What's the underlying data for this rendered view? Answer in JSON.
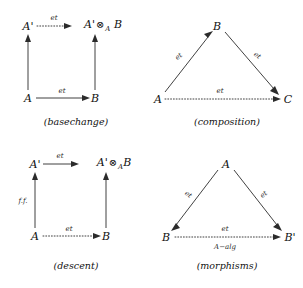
{
  "document": {
    "kind": "commutative-diagram-figure",
    "panel_count": 4
  },
  "panels": [
    {
      "id": "basechange",
      "caption": "(basechange)",
      "shape": "square",
      "nodes": {
        "top_left": "A'",
        "top_right_base": "A'",
        "top_right_tensor": "⊗",
        "top_right_sub": "A",
        "top_right_tail": "B",
        "bottom_left": "A",
        "bottom_right": "B"
      },
      "edges": {
        "top": {
          "label": "et",
          "style": "dotted",
          "direction": "left-to-right"
        },
        "bottom": {
          "label": "et",
          "style": "solid",
          "direction": "left-to-right"
        },
        "left": {
          "label": "",
          "style": "solid",
          "direction": "bottom-to-top"
        },
        "right": {
          "label": "",
          "style": "solid",
          "direction": "bottom-to-top"
        }
      }
    },
    {
      "id": "composition",
      "caption": "(composition)",
      "shape": "triangle",
      "nodes": {
        "apex": "B",
        "bottom_left": "A",
        "bottom_right": "C"
      },
      "edges": {
        "left": {
          "label": "et",
          "style": "solid",
          "direction": "up-right"
        },
        "right": {
          "label": "et",
          "style": "solid",
          "direction": "down-right"
        },
        "base": {
          "label": "et",
          "style": "dotted",
          "direction": "left-to-right"
        }
      }
    },
    {
      "id": "descent",
      "caption": "(descent)",
      "shape": "square",
      "nodes": {
        "top_left": "A'",
        "top_right_base": "A'",
        "top_right_tensor": "⊗",
        "top_right_sub": "A",
        "top_right_tail": "B",
        "bottom_left": "A",
        "bottom_right": "B"
      },
      "edges": {
        "top": {
          "label": "et",
          "style": "solid",
          "direction": "left-to-right"
        },
        "bottom": {
          "label": "et",
          "style": "dotted",
          "direction": "left-to-right"
        },
        "left": {
          "label": "f.f.",
          "style": "solid",
          "direction": "bottom-to-top"
        },
        "right": {
          "label": "",
          "style": "solid",
          "direction": "bottom-to-top"
        }
      }
    },
    {
      "id": "morphisms",
      "caption": "(morphisms)",
      "shape": "triangle",
      "nodes": {
        "apex": "A",
        "bottom_left": "B",
        "bottom_right": "B'"
      },
      "edges": {
        "left": {
          "label": "et",
          "style": "solid",
          "direction": "down-left"
        },
        "right": {
          "label": "et",
          "style": "solid",
          "direction": "down-right"
        },
        "base": {
          "label_above": "et",
          "label_below": "A−alg",
          "style": "dotted",
          "direction": "left-to-right"
        }
      }
    }
  ],
  "colors": {
    "ink": "#2b2b2b",
    "background": "#ffffff"
  }
}
